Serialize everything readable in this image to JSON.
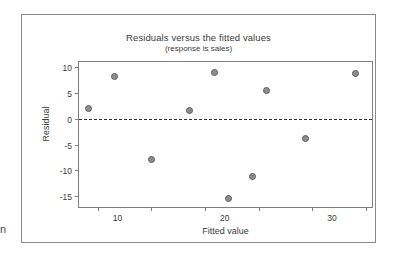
{
  "page": {
    "margin_fragment_text": "n"
  },
  "chart_data": {
    "type": "scatter",
    "title": "Residuals versus the fitted values",
    "subtitle": "(response is sales)",
    "xlabel": "Fitted value",
    "ylabel": "Residual",
    "xlim": [
      6.5,
      61.5
    ],
    "ylim": [
      -17.5,
      11.0
    ],
    "xticks": [
      10,
      20,
      30,
      40,
      50,
      60
    ],
    "xtick_labels": [
      "10",
      "20",
      "30",
      "40",
      "50",
      "60"
    ],
    "yticks": [
      10,
      5,
      0,
      -5,
      -10,
      -15
    ],
    "ytick_labels": [
      "10",
      "5",
      "0",
      "-5",
      "-10",
      "-15"
    ],
    "grid": false,
    "legend": false,
    "reference_line": {
      "orientation": "horizontal",
      "y": 0,
      "style": "dashed"
    },
    "marker": {
      "shape": "circle",
      "fill": "#8d8d8d",
      "edge": "#5d5d5d",
      "size": 5
    },
    "points": [
      {
        "x": 8.0,
        "y": 2.1
      },
      {
        "x": 13.0,
        "y": 8.3
      },
      {
        "x": 19.9,
        "y": -7.8
      },
      {
        "x": 27.0,
        "y": 1.8
      },
      {
        "x": 31.6,
        "y": 9.1
      },
      {
        "x": 34.1,
        "y": -15.2
      },
      {
        "x": 38.6,
        "y": -11.0
      },
      {
        "x": 41.2,
        "y": 5.7
      },
      {
        "x": 48.5,
        "y": -3.6
      },
      {
        "x": 57.9,
        "y": 8.9
      }
    ]
  }
}
